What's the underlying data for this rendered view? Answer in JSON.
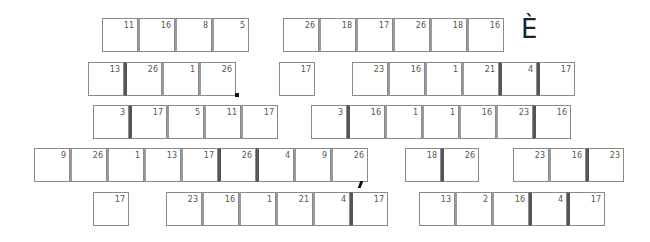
{
  "puzzle": {
    "revealed_letter": "È",
    "rows": [
      {
        "groups": [
          {
            "x": 102,
            "y": 18,
            "cells": [
              {
                "n": "11"
              },
              {
                "n": "16"
              },
              {
                "n": "8"
              },
              {
                "n": "5"
              }
            ]
          },
          {
            "x": 283,
            "y": 18,
            "cells": [
              {
                "n": "26"
              },
              {
                "n": "18"
              },
              {
                "n": "17"
              },
              {
                "n": "26"
              },
              {
                "n": "18"
              },
              {
                "n": "16"
              }
            ]
          }
        ]
      },
      {
        "groups": [
          {
            "x": 88,
            "y": 62,
            "cells": [
              {
                "n": "13"
              },
              {
                "n": "26"
              },
              {
                "n": "1"
              },
              {
                "n": "26"
              }
            ]
          },
          {
            "x": 279,
            "y": 62,
            "cells": [
              {
                "n": "17"
              }
            ]
          },
          {
            "x": 352,
            "y": 62,
            "cells": [
              {
                "n": "23"
              },
              {
                "n": "16"
              },
              {
                "n": "1"
              },
              {
                "n": "21"
              },
              {
                "n": "4"
              },
              {
                "n": "17"
              }
            ]
          }
        ]
      },
      {
        "groups": [
          {
            "x": 93,
            "y": 105,
            "cells": [
              {
                "n": "3"
              },
              {
                "n": "17"
              },
              {
                "n": "5"
              },
              {
                "n": "11"
              },
              {
                "n": "17"
              }
            ]
          },
          {
            "x": 311,
            "y": 105,
            "cells": [
              {
                "n": "3"
              },
              {
                "n": "16"
              },
              {
                "n": "1"
              },
              {
                "n": "1"
              },
              {
                "n": "16"
              },
              {
                "n": "23"
              },
              {
                "n": "16"
              }
            ]
          }
        ]
      },
      {
        "groups": [
          {
            "x": 34,
            "y": 148,
            "cells": [
              {
                "n": "9"
              },
              {
                "n": "26"
              },
              {
                "n": "1"
              },
              {
                "n": "13"
              },
              {
                "n": "17"
              },
              {
                "n": "26"
              },
              {
                "n": "4"
              },
              {
                "n": "9"
              },
              {
                "n": "26"
              }
            ]
          },
          {
            "x": 405,
            "y": 148,
            "cells": [
              {
                "n": "18"
              },
              {
                "n": "26"
              }
            ]
          },
          {
            "x": 513,
            "y": 148,
            "cells": [
              {
                "n": "23"
              },
              {
                "n": "16"
              },
              {
                "n": "23"
              }
            ]
          }
        ]
      },
      {
        "groups": [
          {
            "x": 93,
            "y": 192,
            "cells": [
              {
                "n": "17"
              }
            ]
          },
          {
            "x": 166,
            "y": 192,
            "cells": [
              {
                "n": "23"
              },
              {
                "n": "16"
              },
              {
                "n": "1"
              },
              {
                "n": "21"
              },
              {
                "n": "4"
              },
              {
                "n": "17"
              }
            ]
          },
          {
            "x": 419,
            "y": 192,
            "cells": [
              {
                "n": "13"
              },
              {
                "n": "2"
              },
              {
                "n": "16"
              },
              {
                "n": "4"
              },
              {
                "n": "17"
              }
            ]
          }
        ]
      }
    ],
    "punctuation": [
      {
        "type": "period",
        "after_row": 1
      },
      {
        "type": "apostrophe",
        "after_row": 3
      }
    ]
  }
}
